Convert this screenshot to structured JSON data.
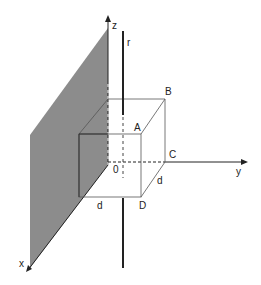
{
  "diagram": {
    "axes": {
      "x": "x",
      "y": "y",
      "z": "z"
    },
    "origin": "0",
    "rod": "r",
    "points": {
      "A": "A",
      "B": "B",
      "C": "C",
      "D": "D"
    },
    "edge_labels": {
      "front_bottom": "d",
      "side_bottom": "d"
    },
    "colors": {
      "plane": "#8c8c8c",
      "lines": "#222222",
      "cube": "#555555"
    }
  }
}
